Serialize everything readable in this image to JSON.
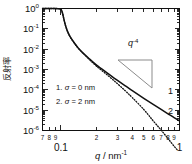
{
  "chart_data": {
    "type": "line",
    "title": "",
    "xlabel": "q / nm⁻¹",
    "ylabel": "反射率",
    "xscale": "log",
    "yscale": "log",
    "xlim": [
      0.07,
      1.0
    ],
    "ylim": [
      1e-06,
      1.0
    ],
    "grid": false,
    "legend_position": "inside-lower-left",
    "x_major_ticks": [
      {
        "value": 0.1,
        "label": "0.1"
      },
      {
        "value": 1.0,
        "label": "1"
      }
    ],
    "x_minor_ticks": [
      {
        "value": 0.07,
        "label": "7"
      },
      {
        "value": 0.08,
        "label": "8"
      },
      {
        "value": 0.09,
        "label": "9"
      },
      {
        "value": 0.2,
        "label": "2"
      },
      {
        "value": 0.3,
        "label": "3"
      },
      {
        "value": 0.4,
        "label": "4"
      },
      {
        "value": 0.5,
        "label": "5"
      },
      {
        "value": 0.6,
        "label": "6"
      },
      {
        "value": 0.7,
        "label": "7"
      },
      {
        "value": 0.8,
        "label": "8"
      },
      {
        "value": 0.9,
        "label": "9"
      }
    ],
    "y_ticks": [
      {
        "value": 1.0,
        "mantissa": "10",
        "exponent": "0"
      },
      {
        "value": 0.1,
        "mantissa": "10",
        "exponent": "-1"
      },
      {
        "value": 0.01,
        "mantissa": "10",
        "exponent": "-2"
      },
      {
        "value": 0.001,
        "mantissa": "10",
        "exponent": "-3"
      },
      {
        "value": 0.0001,
        "mantissa": "10",
        "exponent": "-4"
      },
      {
        "value": 1e-05,
        "mantissa": "10",
        "exponent": "-5"
      },
      {
        "value": 1e-06,
        "mantissa": "10",
        "exponent": "-6"
      }
    ],
    "annotations": [
      {
        "name": "slope-power-law",
        "base": "q",
        "exponent": "-4",
        "text": "q⁻⁴"
      },
      {
        "name": "slope-triangle",
        "description": "right triangle indicating q^-4 slope"
      }
    ],
    "series": [
      {
        "name": "1",
        "label": "1. σ = 0 nm",
        "tag": "1",
        "style": "solid",
        "color": "#111111",
        "roughness_nm": 0,
        "x": [
          0.07,
          0.08,
          0.09,
          0.095,
          0.1,
          0.103,
          0.106,
          0.11,
          0.115,
          0.12,
          0.13,
          0.14,
          0.15,
          0.17,
          0.2,
          0.25,
          0.3,
          0.35,
          0.4,
          0.5,
          0.6,
          0.7,
          0.8,
          0.9,
          1.0
        ],
        "y": [
          1.0,
          1.0,
          1.0,
          0.98,
          0.92,
          0.62,
          0.3,
          0.13,
          0.065,
          0.04,
          0.02,
          0.0115,
          0.0075,
          0.0038,
          0.00165,
          0.00063,
          0.00029,
          0.000155,
          9.2e-05,
          3.85e-05,
          1.92e-05,
          1.08e-05,
          6.6e-06,
          4.3e-06,
          3e-06
        ]
      },
      {
        "name": "2",
        "label": "2. σ = 2 nm",
        "tag": "2",
        "style": "dotted",
        "color": "#111111",
        "roughness_nm": 2,
        "x": [
          0.07,
          0.08,
          0.09,
          0.095,
          0.1,
          0.103,
          0.106,
          0.11,
          0.115,
          0.12,
          0.13,
          0.14,
          0.15,
          0.17,
          0.2,
          0.25,
          0.3,
          0.35,
          0.4,
          0.5,
          0.6,
          0.7,
          0.8,
          0.9,
          0.96
        ],
        "y": [
          1.0,
          1.0,
          1.0,
          0.98,
          0.92,
          0.62,
          0.3,
          0.13,
          0.064,
          0.039,
          0.0195,
          0.0111,
          0.0072,
          0.0035,
          0.00145,
          0.0005,
          0.0002,
          8.8e-05,
          4.15e-05,
          1.08e-05,
          3e-06,
          1.05e-06,
          4e-07,
          1.7e-07,
          1.1e-07
        ]
      }
    ]
  },
  "figure": {
    "axis_x_label_main": "q",
    "axis_x_label_mid": " / nm",
    "axis_x_label_sup": "-1",
    "axis_y_label": "反射率",
    "slope_base": "q",
    "slope_exp": "-4",
    "legend": [
      {
        "index": "1.",
        "sym": "σ",
        "eq": " = 0 nm"
      },
      {
        "index": "2.",
        "sym": "σ",
        "eq": " = 2 nm"
      }
    ],
    "curve_tags": [
      "1",
      "2"
    ],
    "y_tick_labels": [
      {
        "m": "10",
        "e": "0"
      },
      {
        "m": "10",
        "e": "-1"
      },
      {
        "m": "10",
        "e": "-2"
      },
      {
        "m": "10",
        "e": "-3"
      },
      {
        "m": "10",
        "e": "-4"
      },
      {
        "m": "10",
        "e": "-5"
      },
      {
        "m": "10",
        "e": "-6"
      }
    ],
    "x_minor_labels_left": [
      "7",
      "8",
      "9"
    ],
    "x_major_label_left": "0.1",
    "x_minor_labels_right": [
      "2",
      "3",
      "4",
      "5",
      "6",
      "7",
      "8",
      "9"
    ],
    "x_major_label_right": "1"
  }
}
